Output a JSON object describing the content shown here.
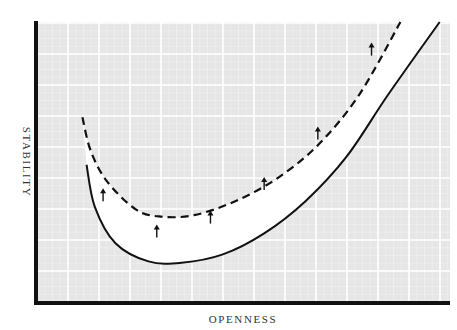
{
  "chart_data": {
    "type": "line",
    "title": "",
    "xlabel": "OPENNESS",
    "ylabel": "STABILITY",
    "xlim": [
      0,
      10
    ],
    "ylim": [
      0,
      10
    ],
    "grid": true,
    "tick_labels_shown": false,
    "legend": "none",
    "series": [
      {
        "name": "original-curve",
        "style": "solid",
        "points": [
          [
            1.2,
            4.9
          ],
          [
            1.4,
            3.4
          ],
          [
            1.9,
            2.1
          ],
          [
            2.7,
            1.45
          ],
          [
            3.5,
            1.4
          ],
          [
            4.5,
            1.7
          ],
          [
            5.5,
            2.45
          ],
          [
            6.5,
            3.6
          ],
          [
            7.5,
            5.2
          ],
          [
            8.5,
            7.4
          ],
          [
            9.75,
            10.0
          ]
        ]
      },
      {
        "name": "shifted-curve",
        "style": "dashed",
        "points": [
          [
            1.1,
            6.6
          ],
          [
            1.3,
            5.4
          ],
          [
            1.7,
            4.3
          ],
          [
            2.4,
            3.3
          ],
          [
            3.0,
            3.05
          ],
          [
            3.8,
            3.1
          ],
          [
            4.8,
            3.6
          ],
          [
            5.8,
            4.4
          ],
          [
            6.8,
            5.6
          ],
          [
            7.8,
            7.4
          ],
          [
            8.8,
            10.0
          ]
        ]
      }
    ],
    "annotations": [
      {
        "type": "arrow",
        "direction": "up",
        "at": [
          1.6,
          3.6
        ]
      },
      {
        "type": "arrow",
        "direction": "up",
        "at": [
          2.9,
          2.3
        ]
      },
      {
        "type": "arrow",
        "direction": "up",
        "at": [
          4.2,
          2.8
        ]
      },
      {
        "type": "arrow",
        "direction": "up",
        "at": [
          5.5,
          4.0
        ]
      },
      {
        "type": "arrow",
        "direction": "up",
        "at": [
          6.8,
          5.8
        ]
      },
      {
        "type": "arrow",
        "direction": "up",
        "at": [
          8.1,
          8.8
        ]
      }
    ]
  }
}
